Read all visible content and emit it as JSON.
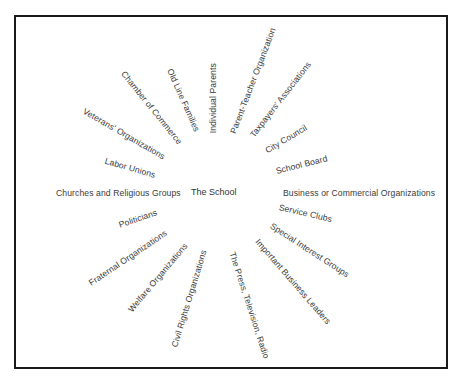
{
  "diagram": {
    "center": "The School",
    "influences_right": [
      {
        "label": "Individual Parents",
        "x": 213,
        "y": 133,
        "angle": -90
      },
      {
        "label": "Parent-Teacher Organization",
        "x": 233,
        "y": 133,
        "angle": -69
      },
      {
        "label": "Taxpayers' Associations",
        "x": 252,
        "y": 136,
        "angle": -52
      },
      {
        "label": "City Council",
        "x": 266,
        "y": 151,
        "angle": -31
      },
      {
        "label": "School Board",
        "x": 276,
        "y": 171,
        "angle": -14
      },
      {
        "label": "Business or Commercial Organizations",
        "x": 283,
        "y": 193,
        "angle": 0
      },
      {
        "label": "Service Clubs",
        "x": 279,
        "y": 207,
        "angle": 13
      },
      {
        "label": "Special Interest Groups",
        "x": 271,
        "y": 225,
        "angle": 33
      },
      {
        "label": "Important Business Leaders",
        "x": 257,
        "y": 240,
        "angle": 49
      },
      {
        "label": "The Press, Television, Radio",
        "x": 232,
        "y": 252,
        "angle": 72
      }
    ],
    "influences_left": [
      {
        "label": "Civil Rights Organizations",
        "x": 204,
        "y": 250,
        "angle": -73
      },
      {
        "label": "Welfare Organizations",
        "x": 186,
        "y": 244,
        "angle": -50
      },
      {
        "label": "Fraternal Organizations",
        "x": 166,
        "y": 232,
        "angle": -34
      },
      {
        "label": "Politicians",
        "x": 157,
        "y": 212,
        "angle": -19
      },
      {
        "label": "Churches and Religious Groups",
        "x": 181,
        "y": 193,
        "angle": 0
      },
      {
        "label": "Labor Unions",
        "x": 155,
        "y": 175,
        "angle": 16
      },
      {
        "label": "Veterans' Organizations",
        "x": 164,
        "y": 157,
        "angle": 30
      },
      {
        "label": "Chamber of Commerce",
        "x": 180,
        "y": 143,
        "angle": 51
      },
      {
        "label": "Old Line Families",
        "x": 197,
        "y": 131,
        "angle": 66
      }
    ]
  }
}
